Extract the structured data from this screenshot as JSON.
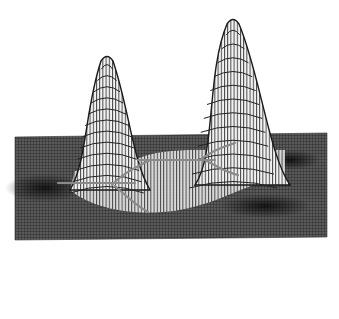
{
  "figure": {
    "background": "#ffffff",
    "mesh_color": "#2a2a2a",
    "plane_color": "#3c3c3c",
    "ridge_color": "#8a8a8a",
    "shadow_color": "#111111"
  },
  "surface": {
    "plane": {
      "top_left": [
        15,
        137
      ],
      "top_right": [
        327,
        133
      ],
      "bottom_right": [
        327,
        237
      ],
      "bottom_left": [
        15,
        240
      ]
    },
    "peaks": [
      {
        "name": "left-peak",
        "apex": [
          107,
          55
        ],
        "base_left": 70,
        "base_right": 150,
        "base_y": 190
      },
      {
        "name": "right-peak",
        "apex": [
          233,
          18
        ],
        "base_left": 195,
        "base_right": 290,
        "base_y": 185
      }
    ],
    "troughs": [
      {
        "name": "left-trough",
        "bottom": [
          140,
          296
        ]
      },
      {
        "name": "right-trough",
        "bottom": [
          208,
          305
        ]
      }
    ],
    "trough_saddle": [
      172,
      262
    ],
    "trough_span": [
      113,
      235
    ]
  }
}
